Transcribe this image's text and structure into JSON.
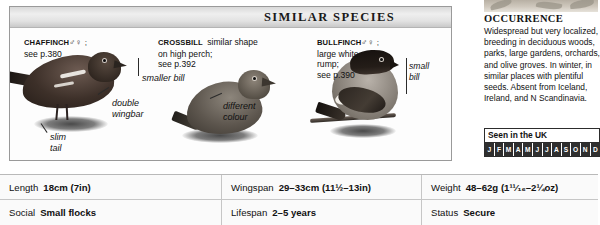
{
  "similar_species": {
    "header_title": "SIMILAR SPECIES",
    "species": [
      {
        "name": "CHAFFINCH",
        "sex": "♂♀ ;",
        "desc": "see p.380"
      },
      {
        "name": "CROSSBILL",
        "sex": "",
        "desc_line1": "similar shape",
        "desc_line2": "on high perch;",
        "desc_line3": "see p.392"
      },
      {
        "name": "BULLFINCH",
        "sex": "♂♀ ;",
        "desc_line1": "large white",
        "desc_line2": "rump;",
        "desc_line3": "see p.390"
      }
    ],
    "annotations": {
      "smaller_bill": "smaller bill",
      "double_wingbar_line1": "double",
      "double_wingbar_line2": "wingbar",
      "slim_tail_line1": "slim",
      "slim_tail_line2": "tail",
      "different_colour_line1": "different",
      "different_colour_line2": "colour",
      "small_bill_line1": "small",
      "small_bill_line2": "bill"
    }
  },
  "occurrence": {
    "title": "OCCURRENCE",
    "text": "Widespread but very localized, breeding in deciduous woods, parks, large gardens, orchards, and olive groves. In winter, in similar places with plentiful seeds. Absent from Iceland, Ireland, and N Scandinavia."
  },
  "seen_in_uk": {
    "title": "Seen in the UK",
    "months": [
      "J",
      "F",
      "M",
      "A",
      "M",
      "J",
      "J",
      "A",
      "S",
      "O",
      "N",
      "D"
    ]
  },
  "stats": {
    "rows": [
      [
        {
          "label": "Length",
          "value": "18cm (7in)"
        },
        {
          "label": "Wingspan",
          "value": "29–33cm (11½–13in)"
        },
        {
          "label": "Weight",
          "value": "48–62g (1¹¹⁄₁₆–2¼oz)"
        }
      ],
      [
        {
          "label": "Social",
          "value": "Small flocks"
        },
        {
          "label": "Lifespan",
          "value": "2–5 years"
        },
        {
          "label": "Status",
          "value": "Secure"
        }
      ]
    ]
  }
}
